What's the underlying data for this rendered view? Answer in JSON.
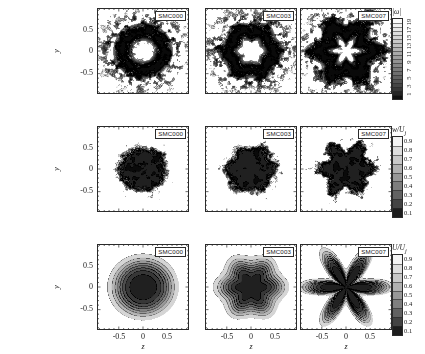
{
  "figure": {
    "axis": {
      "xlabel": "z",
      "ylabel": "y",
      "xticks": [
        "-0.5",
        "0",
        "0.5"
      ],
      "yticks": [
        "0.5",
        "0",
        "-0.5"
      ],
      "xlim": [
        -0.95,
        0.95
      ],
      "ylim": [
        -0.95,
        0.95
      ]
    },
    "cases": [
      "SMC000",
      "SMC003",
      "SMC007"
    ],
    "colors": {
      "ink": "#1a1a1a",
      "frame": "#2b2b2b",
      "background": "#ffffff"
    }
  },
  "rows": [
    {
      "id": "row-vorticity",
      "quantity": "|ω|",
      "colorbar": {
        "title": "|ω|",
        "labels": [
          "19",
          "17",
          "15",
          "13",
          "11",
          "9",
          "7",
          "5",
          "3",
          "1"
        ],
        "values": [
          19,
          17,
          15,
          13,
          11,
          9,
          7,
          5,
          3,
          1
        ],
        "orientation": "vertical",
        "label_rotation": "vertical",
        "nlevels": 20
      },
      "panels": [
        {
          "case": "SMC000",
          "lobes": 0,
          "pattern": "turbulent-annulus",
          "inner_radius": 0.26,
          "outer_radius": 0.6,
          "roughness": 0.85
        },
        {
          "case": "SMC003",
          "lobes": 6,
          "pattern": "turbulent-annulus",
          "inner_radius": 0.27,
          "outer_radius": 0.63,
          "roughness": 0.85
        },
        {
          "case": "SMC007",
          "lobes": 6,
          "pattern": "turbulent-annulus-lobed",
          "inner_radius": 0.24,
          "outer_radius": 0.7,
          "roughness": 1.0
        }
      ]
    },
    {
      "id": "row-axial-velocity-fluct",
      "quantity": "w/U_j",
      "colorbar": {
        "title": "w/U",
        "title_sub": "j",
        "labels": [
          "0.9",
          "0.8",
          "0.7",
          "0.6",
          "0.5",
          "0.4",
          "0.3",
          "0.2",
          "0.1"
        ],
        "values": [
          0.9,
          0.8,
          0.7,
          0.6,
          0.5,
          0.4,
          0.3,
          0.2,
          0.1
        ],
        "orientation": "vertical",
        "label_rotation": "horizontal",
        "nlevels": 9
      },
      "panels": [
        {
          "case": "SMC000",
          "lobes": 0,
          "pattern": "turbulent-core",
          "core_radius": 0.48,
          "roughness": 0.8
        },
        {
          "case": "SMC003",
          "lobes": 6,
          "pattern": "turbulent-core",
          "core_radius": 0.5,
          "roughness": 0.8
        },
        {
          "case": "SMC007",
          "lobes": 6,
          "pattern": "turbulent-core-lobed",
          "core_radius": 0.52,
          "roughness": 1.0
        }
      ]
    },
    {
      "id": "row-mean-velocity",
      "quantity": "U/U_j",
      "colorbar": {
        "title": "U/U",
        "title_sub": "j",
        "labels": [
          "0.9",
          "0.8",
          "0.7",
          "0.6",
          "0.5",
          "0.4",
          "0.3",
          "0.2",
          "0.1"
        ],
        "values": [
          0.9,
          0.8,
          0.7,
          0.6,
          0.5,
          0.4,
          0.3,
          0.2,
          0.1
        ],
        "orientation": "vertical",
        "label_rotation": "horizontal",
        "nlevels": 9
      },
      "panels": [
        {
          "case": "SMC000",
          "lobes": 0,
          "pattern": "smooth-core",
          "core_radius": 0.5,
          "roughness": 0.0
        },
        {
          "case": "SMC003",
          "lobes": 6,
          "pattern": "smooth-core",
          "core_radius": 0.5,
          "roughness": 0.0,
          "lobe_amp": 0.05
        },
        {
          "case": "SMC007",
          "lobes": 6,
          "pattern": "smooth-core-star",
          "core_radius": 0.46,
          "roughness": 0.0,
          "lobe_amp": 0.3
        }
      ]
    }
  ],
  "chart_data": {
    "type": "heatmap",
    "title": "",
    "xlabel": "z",
    "ylabel": "y",
    "xlim": [
      -0.95,
      0.95
    ],
    "ylim": [
      -0.95,
      0.95
    ],
    "grid": false,
    "legend": "right colorbars, one per row",
    "layout": {
      "rows": 3,
      "cols": 3
    },
    "columns": [
      "SMC000",
      "SMC003",
      "SMC007"
    ],
    "row_quantities": [
      "|ω|",
      "w/U_j",
      "U/U_j"
    ],
    "colorbars": [
      {
        "row": 0,
        "quantity": "|ω|",
        "ticks": [
          1,
          3,
          5,
          7,
          9,
          11,
          13,
          15,
          17,
          19
        ],
        "range": [
          0,
          20
        ]
      },
      {
        "row": 1,
        "quantity": "w/U_j",
        "ticks": [
          0.1,
          0.2,
          0.3,
          0.4,
          0.5,
          0.6,
          0.7,
          0.8,
          0.9
        ],
        "range": [
          0,
          1
        ]
      },
      {
        "row": 2,
        "quantity": "U/U_j",
        "ticks": [
          0.1,
          0.2,
          0.3,
          0.4,
          0.5,
          0.6,
          0.7,
          0.8,
          0.9
        ],
        "range": [
          0,
          1
        ]
      }
    ],
    "xticks": [
      -0.5,
      0,
      0.5
    ],
    "yticks": [
      -0.5,
      0,
      0.5
    ],
    "colormap": "grayscale-inverted"
  }
}
